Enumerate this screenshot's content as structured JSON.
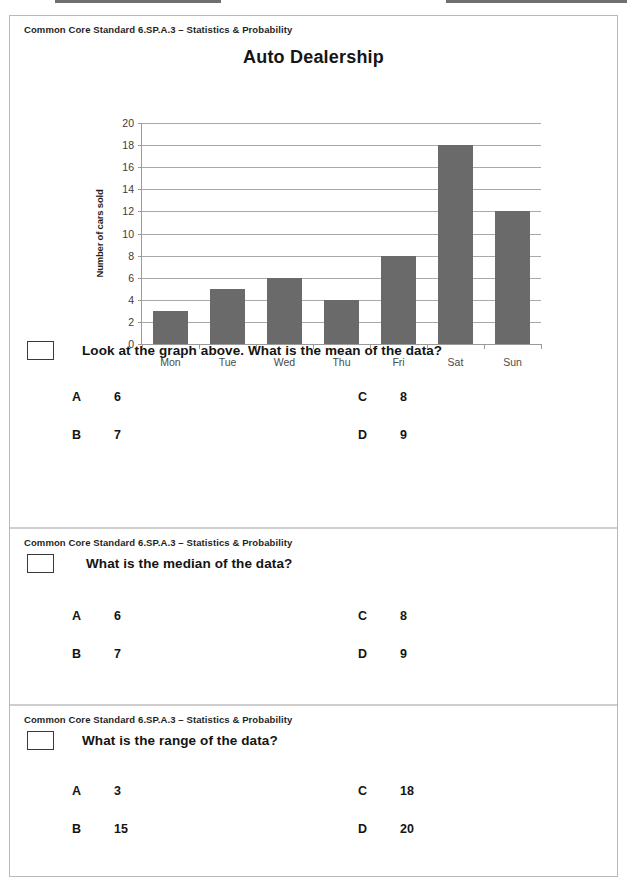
{
  "page": {
    "standard_label": "Common Core Standard 6.SP.A.3 – Statistics & Probability"
  },
  "chart_data": {
    "type": "bar",
    "title": "Auto Dealership",
    "xlabel": "",
    "ylabel": "Number of cars sold",
    "categories": [
      "Mon",
      "Tue",
      "Wed",
      "Thu",
      "Fri",
      "Sat",
      "Sun"
    ],
    "values": [
      3,
      5,
      6,
      4,
      8,
      18,
      12
    ],
    "ylim": [
      0,
      20
    ],
    "ytick_step": 2,
    "yticks": [
      20,
      18,
      16,
      14,
      12,
      10,
      8,
      6,
      4,
      2,
      0
    ],
    "grid": true,
    "legend": "none",
    "bar_color": "#6a6a6a",
    "axis_color": "#9a9a9a"
  },
  "sections": [
    {
      "standard": "Common Core Standard 6.SP.A.3 – Statistics & Probability",
      "question": "Look at the graph above. What is the mean of the data?",
      "choices": [
        {
          "letter": "A",
          "value": "6"
        },
        {
          "letter": "C",
          "value": "8"
        },
        {
          "letter": "B",
          "value": "7"
        },
        {
          "letter": "D",
          "value": "9"
        }
      ]
    },
    {
      "standard": "Common Core Standard 6.SP.A.3 – Statistics & Probability",
      "question": "What is the median of the data?",
      "choices": [
        {
          "letter": "A",
          "value": "6"
        },
        {
          "letter": "C",
          "value": "8"
        },
        {
          "letter": "B",
          "value": "7"
        },
        {
          "letter": "D",
          "value": "9"
        }
      ]
    },
    {
      "standard": "Common Core Standard 6.SP.A.3 – Statistics & Probability",
      "question": "What is the range of the data?",
      "choices": [
        {
          "letter": "A",
          "value": "3"
        },
        {
          "letter": "C",
          "value": "18"
        },
        {
          "letter": "B",
          "value": "15"
        },
        {
          "letter": "D",
          "value": "20"
        }
      ]
    }
  ]
}
